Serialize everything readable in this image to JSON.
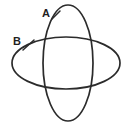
{
  "figure": {
    "background_color": "#ffffff",
    "stroke_color": "#2b2b2b",
    "label_color": "#1f1f1f",
    "width": 127,
    "height": 128,
    "shapes": [
      {
        "id": "ellipse-a",
        "kind": "ellipse",
        "orientation": "vertical",
        "label": "A",
        "cx": 68,
        "cy": 63,
        "rx": 25,
        "ry": 58,
        "stroke_width": 1.7
      },
      {
        "id": "ellipse-b",
        "kind": "ellipse",
        "orientation": "horizontal",
        "label": "B",
        "cx": 66,
        "cy": 63,
        "rx": 54,
        "ry": 26,
        "stroke_width": 1.7
      }
    ],
    "labels": [
      {
        "id": "label-a",
        "text": "A",
        "x": 42,
        "y": 8,
        "leader": {
          "x1": 52,
          "y1": 19,
          "x2": 60,
          "y2": 11
        }
      },
      {
        "id": "label-b",
        "text": "B",
        "x": 13,
        "y": 36,
        "leader": {
          "x1": 23,
          "y1": 50,
          "x2": 34,
          "y2": 40
        }
      }
    ]
  }
}
